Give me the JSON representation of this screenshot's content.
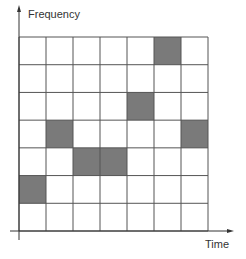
{
  "diagram": {
    "y_axis_label": "Frequency",
    "x_axis_label": "Time",
    "grid": {
      "columns": 7,
      "rows": 7,
      "shaded_cells": [
        {
          "col": 5,
          "row": 0
        },
        {
          "col": 4,
          "row": 2
        },
        {
          "col": 1,
          "row": 3
        },
        {
          "col": 6,
          "row": 3
        },
        {
          "col": 2,
          "row": 4
        },
        {
          "col": 3,
          "row": 4
        },
        {
          "col": 0,
          "row": 5
        }
      ]
    },
    "colors": {
      "shaded": "#7a7a7a",
      "grid_line": "#555555",
      "axis": "#333333"
    }
  }
}
